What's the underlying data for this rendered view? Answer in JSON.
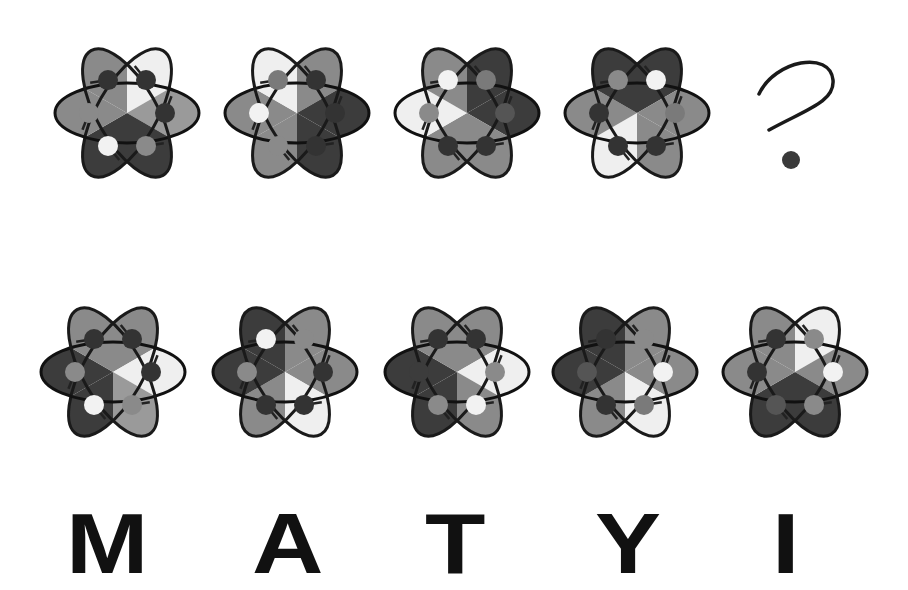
{
  "puzzle": {
    "sequence_label": "sequence",
    "question_symbol": "?",
    "colors": {
      "white": "#efefef",
      "light": "#9a9a9a",
      "mid": "#7c7c7c",
      "dark": "#3c3c3c",
      "outline": "#111111",
      "outline_light": "#8c8c8c"
    },
    "sequence": [
      {
        "id": "seq-1",
        "sectors": [
          "#efefef",
          "#9a9a9a",
          "#3c3c3c",
          "#3c3c3c",
          "#8a8a8a",
          "#8a8a8a"
        ],
        "dots": [
          "#333",
          "#333",
          "#8a8a8a",
          "#f2f2f2",
          "#8a8a8a",
          "#333"
        ]
      },
      {
        "id": "seq-2",
        "sectors": [
          "#8a8a8a",
          "#3c3c3c",
          "#3c3c3c",
          "#8a8a8a",
          "#8a8a8a",
          "#efefef"
        ],
        "dots": [
          "#333",
          "#333",
          "#333",
          "#8a8a8a",
          "#f2f2f2",
          "#7a7a7a"
        ]
      },
      {
        "id": "seq-3",
        "sectors": [
          "#3c3c3c",
          "#3c3c3c",
          "#8a8a8a",
          "#8a8a8a",
          "#efefef",
          "#8a8a8a"
        ],
        "dots": [
          "#7a7a7a",
          "#555",
          "#333",
          "#333",
          "#8a8a8a",
          "#f2f2f2"
        ]
      },
      {
        "id": "seq-4",
        "sectors": [
          "#3c3c3c",
          "#8a8a8a",
          "#8a8a8a",
          "#efefef",
          "#8a8a8a",
          "#3c3c3c"
        ],
        "dots": [
          "#f2f2f2",
          "#7a7a7a",
          "#333",
          "#333",
          "#333",
          "#8a8a8a"
        ]
      }
    ],
    "options": [
      {
        "id": "option-M",
        "letter": "M",
        "sectors": [
          "#8a8a8a",
          "#efefef",
          "#9a9a9a",
          "#3c3c3c",
          "#3c3c3c",
          "#8a8a8a"
        ],
        "dots": [
          "#333",
          "#333",
          "#8a8a8a",
          "#f2f2f2",
          "#8a8a8a",
          "#333"
        ]
      },
      {
        "id": "option-A",
        "letter": "A",
        "sectors": [
          "#8a8a8a",
          "#8a8a8a",
          "#efefef",
          "#8a8a8a",
          "#3c3c3c",
          "#3c3c3c"
        ],
        "dots": [
          "#8a8a8a",
          "#333",
          "#333",
          "#333",
          "#8a8a8a",
          "#f2f2f2"
        ]
      },
      {
        "id": "option-T",
        "letter": "T",
        "sectors": [
          "#8a8a8a",
          "#efefef",
          "#8a8a8a",
          "#3c3c3c",
          "#3c3c3c",
          "#8a8a8a"
        ],
        "dots": [
          "#333",
          "#8a8a8a",
          "#f2f2f2",
          "#8a8a8a",
          "#3c3c3c",
          "#333"
        ]
      },
      {
        "id": "option-Y",
        "letter": "Y",
        "sectors": [
          "#8a8a8a",
          "#8a8a8a",
          "#efefef",
          "#8a8a8a",
          "#3c3c3c",
          "#3c3c3c"
        ],
        "dots": [
          "#8a8a8a",
          "#f2f2f2",
          "#7a7a7a",
          "#333",
          "#555",
          "#333"
        ]
      },
      {
        "id": "option-I",
        "letter": "I",
        "sectors": [
          "#efefef",
          "#8a8a8a",
          "#3c3c3c",
          "#3c3c3c",
          "#8a8a8a",
          "#8a8a8a"
        ],
        "dots": [
          "#8a8a8a",
          "#f2f2f2",
          "#8a8a8a",
          "#555",
          "#333",
          "#333"
        ]
      }
    ],
    "letters": [
      "M",
      "A",
      "T",
      "Y",
      "I"
    ]
  }
}
